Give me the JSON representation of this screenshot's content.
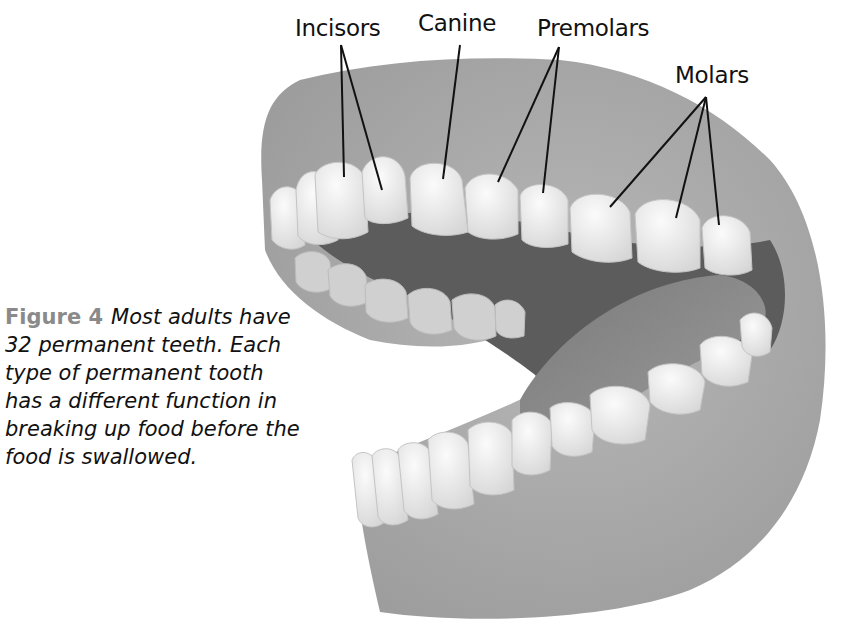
{
  "figure": {
    "labels": {
      "incisors": "Incisors",
      "canine": "Canine",
      "premolars": "Premolars",
      "molars": "Molars"
    },
    "caption": {
      "figure_number": "Figure 4",
      "text": "Most adults have 32 permanent teeth. Each type of permanent tooth has a different function in breaking up food before the food is swallowed."
    },
    "colors": {
      "gum": "#a9a9a9",
      "gum_dark": "#8f8f8f",
      "mouth_interior": "#5a5a5a",
      "tooth": "#efefef",
      "label_text": "#111111",
      "figure_number": "#8a8a8a"
    }
  }
}
